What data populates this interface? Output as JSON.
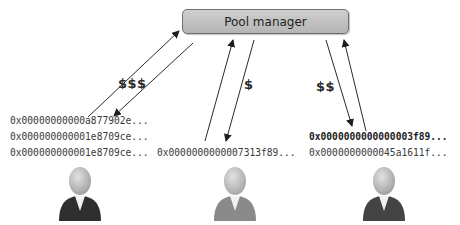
{
  "diagram": {
    "pool_manager": {
      "label": "Pool manager",
      "color": "#c2c2c2"
    },
    "miners": [
      {
        "id": "left",
        "payout_label": "$$$",
        "hashes": [
          "0x00000000000a877902e...",
          "0x000000000001e8709ce...",
          "0x000000000001e8709ce..."
        ],
        "hash_bold_index": -1,
        "icon_color": "#2f2f2f"
      },
      {
        "id": "middle",
        "payout_label": "$",
        "hashes": [
          "0x0000000000007313f89..."
        ],
        "hash_bold_index": -1,
        "icon_color": "#8a8a8a"
      },
      {
        "id": "right",
        "payout_label": "$$",
        "hashes": [
          "0x0000000000000003f89...",
          "0x0000000000045a1611f..."
        ],
        "hash_bold_index": 0,
        "icon_color": "#444444"
      }
    ]
  }
}
